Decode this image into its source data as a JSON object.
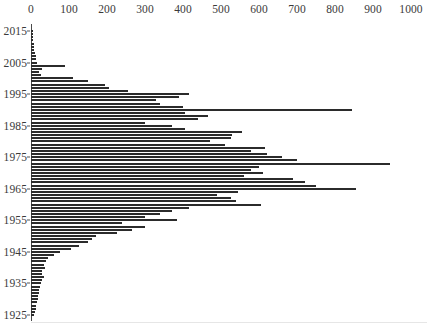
{
  "chart_data": {
    "type": "bar",
    "orientation": "horizontal",
    "title": "",
    "subtitle": "",
    "xlabel": "",
    "ylabel": "",
    "xlim": [
      0,
      1000
    ],
    "ylim": [
      1925,
      2015
    ],
    "grid": false,
    "legend": null,
    "bar_color": "#2b2b2b",
    "axis_color": "#3a3a3a",
    "background": "#ffffff",
    "xticks": [
      0,
      100,
      200,
      300,
      400,
      500,
      600,
      700,
      800,
      900,
      1000
    ],
    "xtick_labels": [
      "0",
      "100",
      "200",
      "300",
      "400",
      "500",
      "600",
      "700",
      "800",
      "900",
      "1000"
    ],
    "yticks": [
      2015,
      2005,
      1995,
      1985,
      1975,
      1965,
      1955,
      1945,
      1935,
      1925
    ],
    "ytick_labels": [
      "2015",
      "2005",
      "1995",
      "1985",
      "1975",
      "1965",
      "1955",
      "1945",
      "1935",
      "1925"
    ],
    "categories": [
      2015,
      2014,
      2013,
      2012,
      2011,
      2010,
      2009,
      2008,
      2007,
      2006,
      2005,
      2004,
      2003,
      2002,
      2001,
      2000,
      1999,
      1998,
      1997,
      1996,
      1995,
      1994,
      1993,
      1992,
      1991,
      1990,
      1989,
      1988,
      1987,
      1986,
      1985,
      1984,
      1983,
      1982,
      1981,
      1980,
      1979,
      1978,
      1977,
      1976,
      1975,
      1974,
      1973,
      1972,
      1971,
      1970,
      1969,
      1968,
      1967,
      1966,
      1965,
      1964,
      1963,
      1962,
      1961,
      1960,
      1959,
      1958,
      1957,
      1956,
      1955,
      1954,
      1953,
      1952,
      1951,
      1950,
      1949,
      1948,
      1947,
      1946,
      1945,
      1944,
      1943,
      1942,
      1941,
      1940,
      1939,
      1938,
      1937,
      1936,
      1935,
      1934,
      1933,
      1932,
      1931,
      1930,
      1929,
      1928,
      1927,
      1926,
      1925
    ],
    "values": [
      4,
      5,
      6,
      6,
      7,
      8,
      9,
      10,
      12,
      14,
      16,
      90,
      30,
      22,
      26,
      110,
      150,
      195,
      205,
      255,
      415,
      390,
      330,
      340,
      400,
      845,
      405,
      465,
      440,
      300,
      370,
      405,
      555,
      530,
      525,
      470,
      510,
      615,
      580,
      620,
      660,
      700,
      945,
      600,
      580,
      610,
      560,
      690,
      720,
      750,
      855,
      545,
      490,
      525,
      540,
      605,
      415,
      370,
      340,
      300,
      385,
      240,
      300,
      265,
      225,
      170,
      160,
      150,
      125,
      105,
      75,
      60,
      45,
      40,
      35,
      38,
      30,
      28,
      34,
      30,
      26,
      24,
      22,
      20,
      18,
      18,
      16,
      14,
      12,
      10,
      8
    ]
  }
}
